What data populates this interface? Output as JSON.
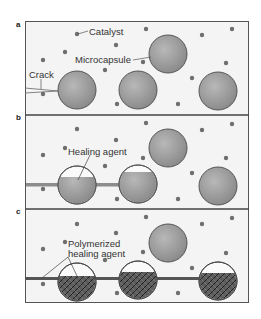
{
  "figure": {
    "panels": [
      {
        "id": "a",
        "label": "a"
      },
      {
        "id": "b",
        "label": "b"
      },
      {
        "id": "c",
        "label": "c"
      }
    ],
    "labels": {
      "catalyst": "Catalyst",
      "microcapsule": "Microcapsule",
      "crack": "Crack",
      "healing_agent": "Healing agent",
      "polymerized_line1": "Polymerized",
      "polymerized_line2": "healing agent"
    },
    "colors": {
      "capsule_fill": "#9a9a9a",
      "capsule_stroke": "#5a5a5a",
      "catalyst": "#6e6e6e",
      "border": "#555555",
      "background": "#f4f4f4",
      "polymer": "#3a3a3a"
    }
  }
}
